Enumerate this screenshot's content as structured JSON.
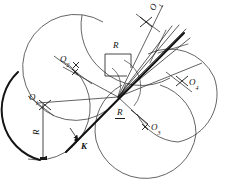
{
  "figure": {
    "type": "geometric-construction-diagram",
    "background_color": "#ffffff",
    "ink_color": "#1a1a1a",
    "thin_stroke_color": "#4a4a4a",
    "labels": {
      "o_top": {
        "base": "O",
        "sub": "1",
        "x": 148,
        "y": 11,
        "rotation": -62
      },
      "o_two": {
        "base": "O",
        "sub": "2",
        "x": 64,
        "y": 58,
        "rotation": 0
      },
      "o_one_left": {
        "base": "O",
        "sub": "1",
        "x": 31,
        "y": 97,
        "rotation": 0
      },
      "o_four": {
        "base": "O",
        "sub": "4",
        "x": 190,
        "y": 82,
        "rotation": 0
      },
      "o_three": {
        "base": "O",
        "sub": "3",
        "x": 152,
        "y": 128,
        "rotation": 0
      },
      "k_point": {
        "base": "K",
        "x": 82,
        "y": 145
      },
      "r_top": {
        "base": "R",
        "x": 115,
        "y": 43,
        "style": "plain"
      },
      "r_left": {
        "base": "R",
        "x": 34,
        "y": 131,
        "style": "rotated",
        "rotation": -90
      },
      "r_lower_right": {
        "base": "R",
        "x": 118,
        "y": 113,
        "style": "underlined"
      }
    },
    "circle_centers": [
      {
        "name": "O1-top",
        "cx": 139,
        "cy": 23,
        "r": 58
      },
      {
        "name": "O2",
        "cx": 77,
        "cy": 69,
        "r": 53
      },
      {
        "name": "O1-left",
        "cx": 41,
        "cy": 108,
        "r": 52
      },
      {
        "name": "O4",
        "cx": 178,
        "cy": 93,
        "r": 49
      },
      {
        "name": "O3",
        "cx": 145,
        "cy": 131,
        "r": 51
      }
    ],
    "convergence_point": {
      "x": 118,
      "y": 97
    },
    "radius_symbol": "R",
    "point_symbol": "K"
  }
}
